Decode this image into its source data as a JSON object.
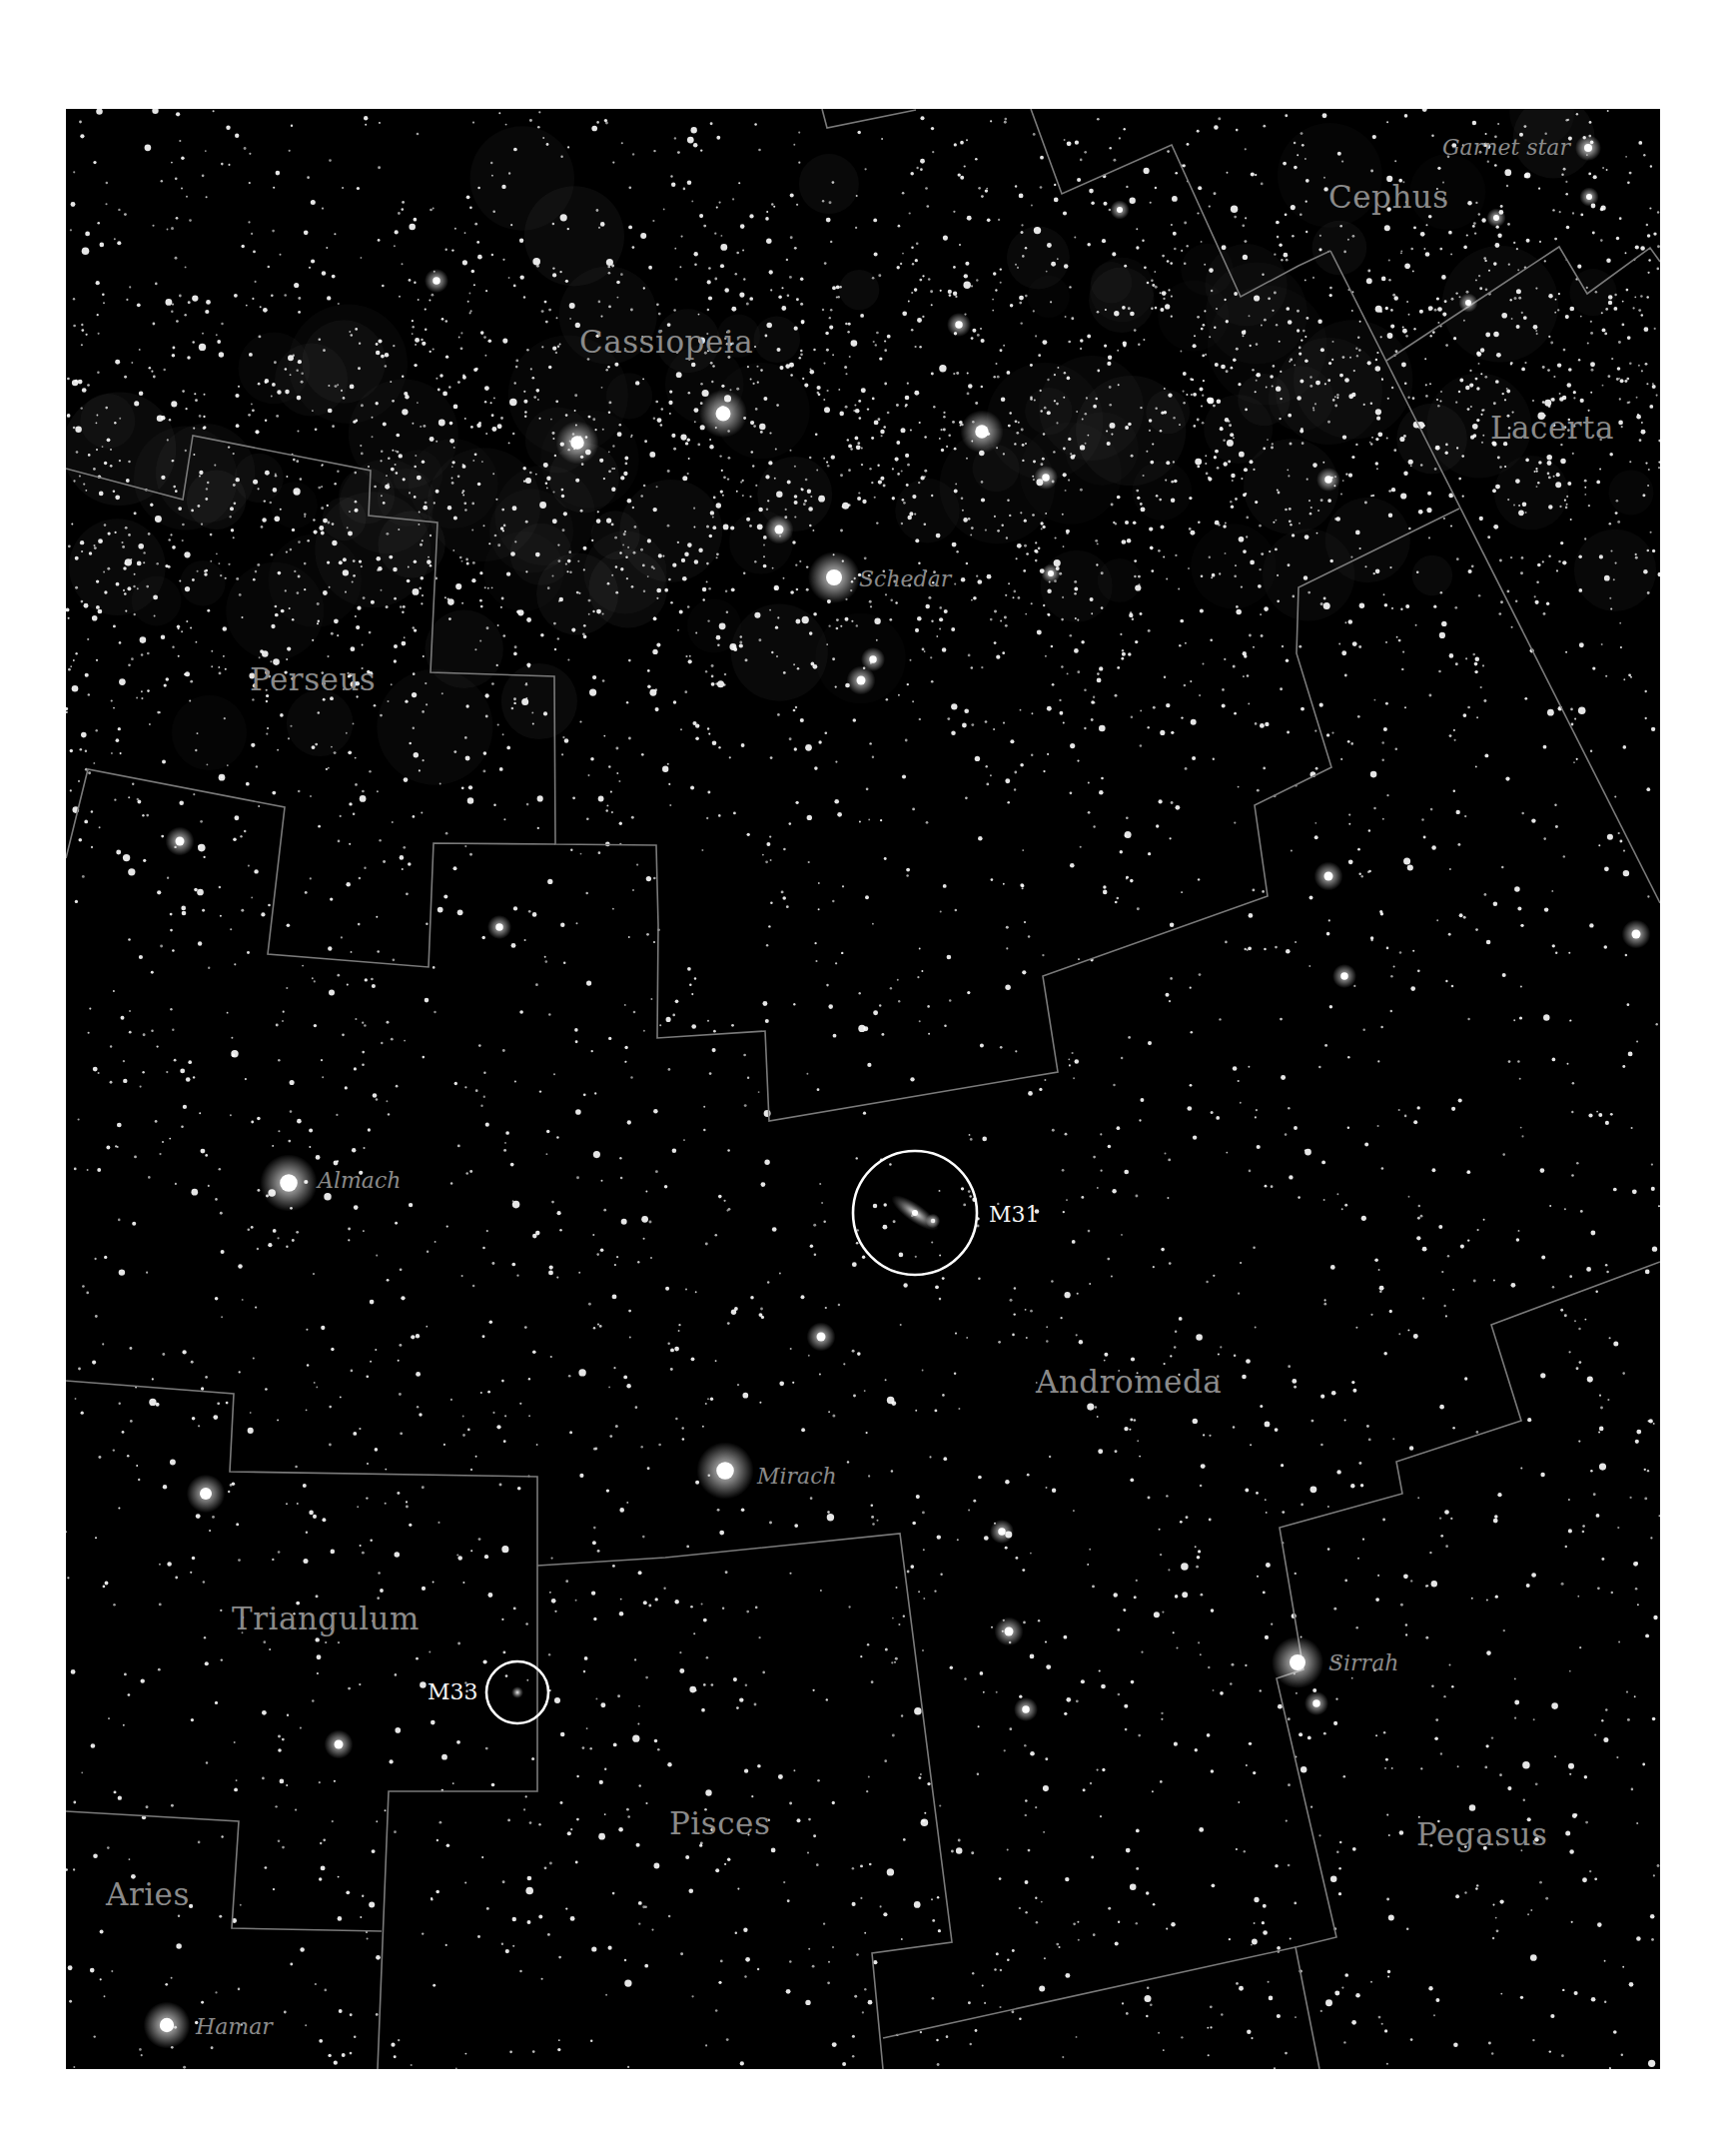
{
  "map": {
    "background": "#000000",
    "boundary_color": "#7a7a7a",
    "label_color": "#8a8a8a",
    "marker_color": "#ffffff",
    "constellations": [
      {
        "name": "Cephus",
        "x": 1330,
        "y": 197
      },
      {
        "name": "Cassiopeia",
        "x": 580,
        "y": 342
      },
      {
        "name": "Lacerta",
        "x": 1492,
        "y": 428
      },
      {
        "name": "Perseus",
        "x": 250,
        "y": 680
      },
      {
        "name": "Andromeda",
        "x": 1037,
        "y": 1383
      },
      {
        "name": "Triangulum",
        "x": 232,
        "y": 1620
      },
      {
        "name": "Pisces",
        "x": 670,
        "y": 1825
      },
      {
        "name": "Pegasus",
        "x": 1418,
        "y": 1836
      },
      {
        "name": "Aries",
        "x": 106,
        "y": 1896
      }
    ],
    "named_stars": [
      {
        "name": "Garnet star",
        "x": 1590,
        "y": 148,
        "r": 5,
        "label_x": 1444,
        "label_y": 148
      },
      {
        "name": "Schedar",
        "x": 835,
        "y": 578,
        "r": 10,
        "label_x": 860,
        "label_y": 580
      },
      {
        "name": "Almach",
        "x": 289,
        "y": 1184,
        "r": 11,
        "label_x": 318,
        "label_y": 1182
      },
      {
        "name": "Mirach",
        "x": 726,
        "y": 1472,
        "r": 11,
        "label_x": 758,
        "label_y": 1478
      },
      {
        "name": "Sirrah",
        "x": 1299,
        "y": 1664,
        "r": 10,
        "label_x": 1330,
        "label_y": 1665
      },
      {
        "name": "Hamar",
        "x": 167,
        "y": 2027,
        "r": 9,
        "label_x": 196,
        "label_y": 2029
      }
    ],
    "deep_sky_objects": [
      {
        "name": "M31",
        "x": 916,
        "y": 1214,
        "r": 62,
        "label_x": 990,
        "label_y": 1216,
        "ellipse_rx": 28,
        "ellipse_ry": 9,
        "angle": 35
      },
      {
        "name": "M33",
        "x": 518,
        "y": 1694,
        "r": 31,
        "label_x": 428,
        "label_y": 1694,
        "ellipse_rx": 6,
        "ellipse_ry": 6,
        "angle": 0
      }
    ],
    "bright_stars": [
      [
        724,
        414,
        10
      ],
      [
        578,
        443,
        9
      ],
      [
        983,
        432,
        9
      ],
      [
        780,
        530,
        6
      ],
      [
        862,
        681,
        6
      ],
      [
        874,
        660,
        5
      ],
      [
        1330,
        480,
        5
      ],
      [
        437,
        281,
        5
      ],
      [
        180,
        842,
        6
      ],
      [
        1330,
        877,
        6
      ],
      [
        1638,
        935,
        6
      ],
      [
        1346,
        977,
        5
      ],
      [
        934,
        1222,
        3
      ],
      [
        206,
        1495,
        8
      ],
      [
        822,
        1338,
        6
      ],
      [
        1010,
        1633,
        6
      ],
      [
        1027,
        1711,
        5
      ],
      [
        1318,
        1705,
        5
      ],
      [
        339,
        1746,
        6
      ],
      [
        1121,
        210,
        4
      ],
      [
        1498,
        218,
        4
      ],
      [
        1591,
        197,
        4
      ],
      [
        1003,
        1533,
        5
      ],
      [
        500,
        928,
        5
      ],
      [
        1470,
        303,
        4
      ],
      [
        960,
        325,
        5
      ],
      [
        1047,
        478,
        5
      ],
      [
        1052,
        574,
        4
      ]
    ],
    "boundaries": [
      [
        [
          66,
          469
        ],
        [
          183,
          500
        ],
        [
          193,
          436
        ],
        [
          371,
          471
        ],
        [
          369,
          516
        ],
        [
          438,
          523
        ],
        [
          431,
          673
        ],
        [
          555,
          677
        ],
        [
          556,
          845
        ],
        [
          657,
          846
        ],
        [
          659,
          926
        ]
      ],
      [
        [
          66,
          859
        ],
        [
          88,
          770
        ],
        [
          285,
          808
        ],
        [
          268,
          955
        ],
        [
          429,
          968
        ],
        [
          434,
          844
        ],
        [
          556,
          845
        ]
      ],
      [
        [
          659,
          926
        ],
        [
          658,
          1039
        ],
        [
          766,
          1032
        ],
        [
          770,
          1122
        ],
        [
          1059,
          1073
        ],
        [
          1044,
          977
        ],
        [
          1269,
          897
        ],
        [
          1256,
          806
        ],
        [
          1333,
          768
        ],
        [
          1298,
          654
        ],
        [
          1300,
          588
        ],
        [
          1461,
          509
        ]
      ],
      [
        [
          823,
          109
        ],
        [
          828,
          128
        ],
        [
          917,
          110
        ]
      ],
      [
        [
          1032,
          109
        ],
        [
          1063,
          194
        ],
        [
          1173,
          145
        ],
        [
          1242,
          297
        ],
        [
          1300,
          266
        ],
        [
          1332,
          251
        ]
      ],
      [
        [
          1332,
          251
        ],
        [
          1662,
          904
        ]
      ],
      [
        [
          1388,
          361
        ],
        [
          1561,
          247
        ],
        [
          1589,
          294
        ],
        [
          1652,
          248
        ],
        [
          1662,
          262
        ]
      ],
      [
        [
          66,
          1382
        ],
        [
          234,
          1395
        ],
        [
          230,
          1473
        ],
        [
          538,
          1478
        ],
        [
          538,
          1793
        ],
        [
          389,
          1793
        ],
        [
          378,
          2071
        ]
      ],
      [
        [
          538,
          1567
        ],
        [
          666,
          1559
        ],
        [
          901,
          1535
        ],
        [
          953,
          1944
        ],
        [
          873,
          1955
        ],
        [
          884,
          2071
        ]
      ],
      [
        [
          66,
          1813
        ],
        [
          239,
          1823
        ],
        [
          232,
          1930
        ],
        [
          382,
          1933
        ]
      ],
      [
        [
          1662,
          1263
        ],
        [
          1493,
          1326
        ],
        [
          1523,
          1422
        ],
        [
          1398,
          1463
        ],
        [
          1404,
          1495
        ],
        [
          1281,
          1529
        ],
        [
          1305,
          1671
        ],
        [
          1278,
          1680
        ],
        [
          1338,
          1939
        ],
        [
          1297,
          1949
        ],
        [
          1321,
          2071
        ]
      ],
      [
        [
          884,
          2040
        ],
        [
          1297,
          1949
        ]
      ]
    ]
  }
}
